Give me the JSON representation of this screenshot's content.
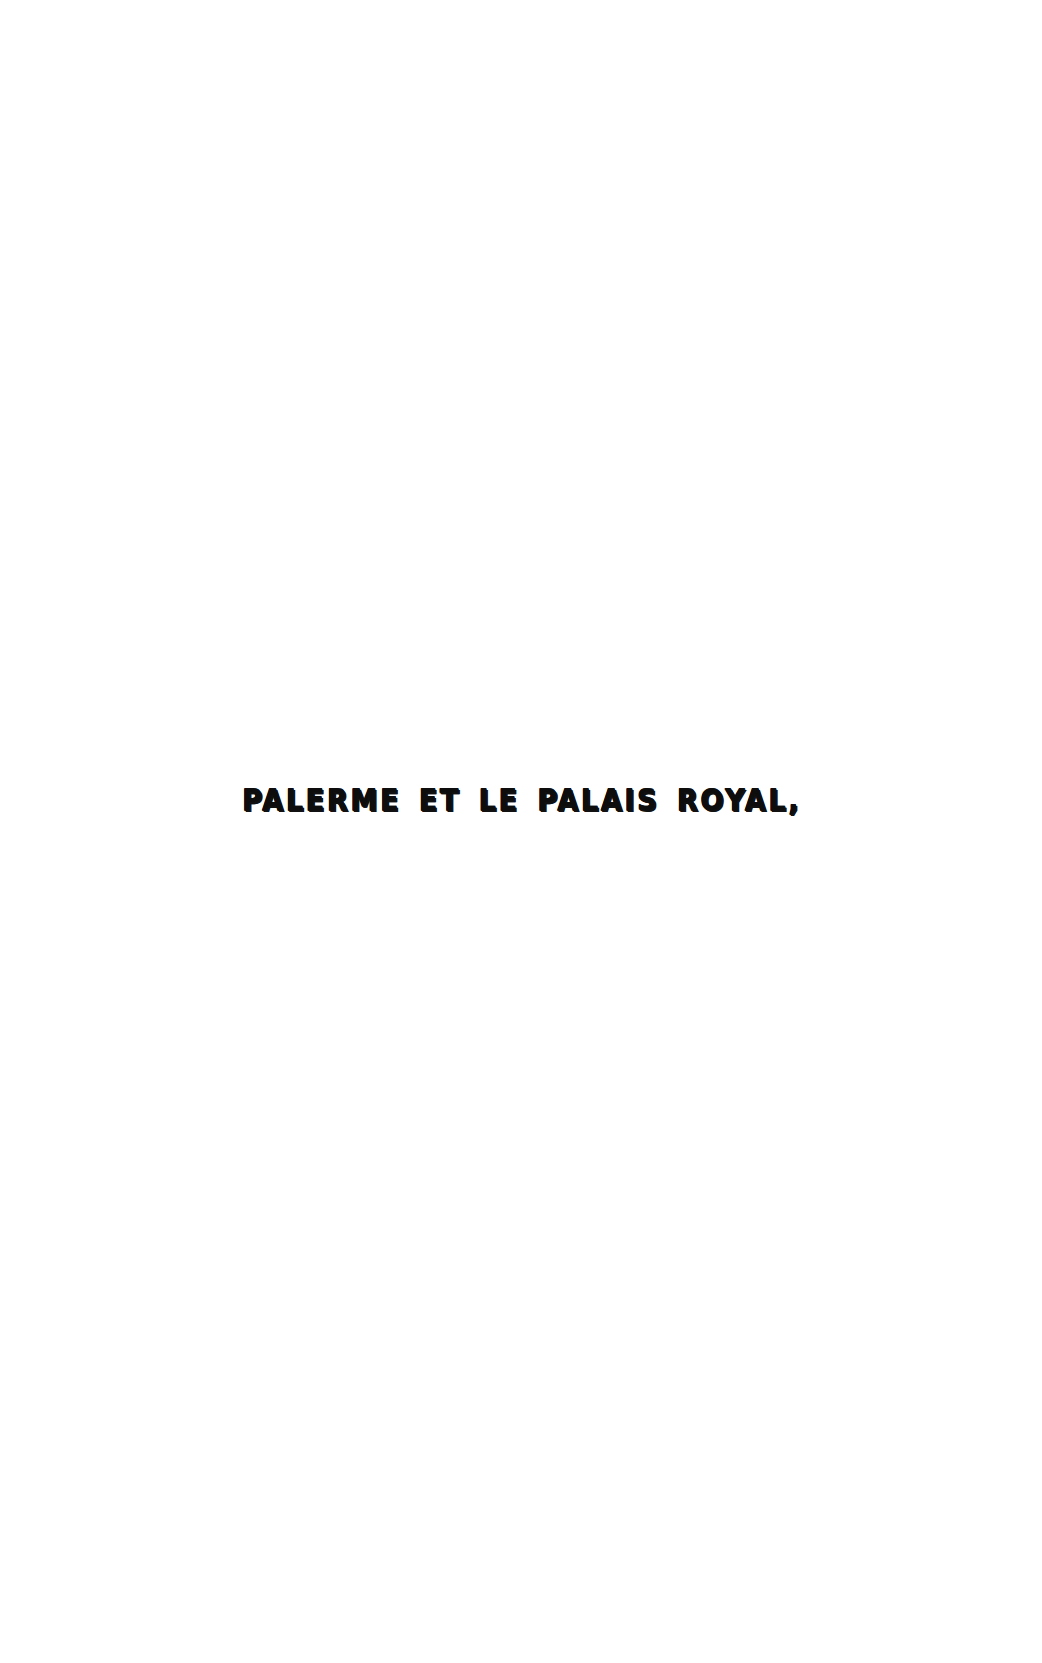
{
  "page": {
    "background_color": "#ffffff",
    "width": 1042,
    "height": 1663,
    "kind": "scanned-book-page"
  },
  "heading": {
    "text": "PALERME ET LE PALAIS ROYAL,",
    "color": "#0d0d0d",
    "shadow_color": "#111111",
    "style": "bold-condensed-display-caps-with-drop-shadow",
    "alignment": "center"
  }
}
